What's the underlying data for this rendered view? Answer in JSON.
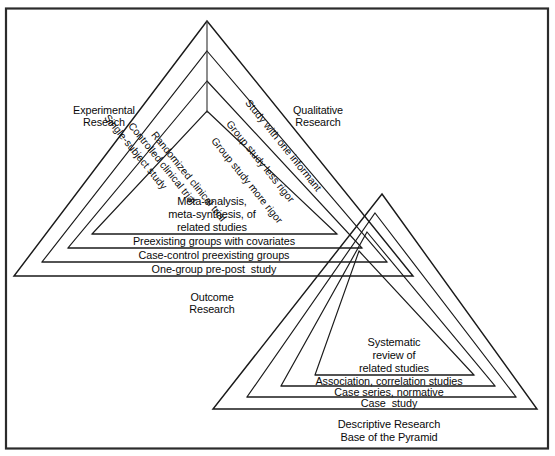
{
  "figure": {
    "line_color": "#1a1a1a",
    "frame_color": "#2b2b2b",
    "background": "#ffffff"
  },
  "main_pyramid": {
    "side_labels": {
      "left_outer": "Experimental\nReseach",
      "right_outer": "Qualitative\nResearch",
      "below": "Outcome\nResearch"
    },
    "left_slope_labels": [
      "Single-subject study",
      "Controlled clinical trial",
      "Randomized clinical trial"
    ],
    "right_slope_labels": [
      "Study with one informant",
      "Group study less rigor",
      "Group study more rigor"
    ],
    "core_label": "Meta-analysis,\nmeta-synthesis, of\nrelated studies",
    "band_labels": [
      "Preexisting groups with covariates",
      "Case-control preexisting groups",
      "One-group pre-post  study"
    ]
  },
  "base_pyramid": {
    "core_label": "Systematic\nreview of\nrelated studies",
    "band_labels": [
      "Association, correlation studies",
      "Case series, normative",
      "Case  study"
    ],
    "caption": "Descriptive Research\nBase of the Pyramid"
  }
}
